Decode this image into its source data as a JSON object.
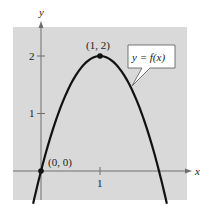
{
  "chart_data": {
    "type": "line",
    "title": "",
    "xlabel": "x",
    "ylabel": "y",
    "function_label": "y = f(x)",
    "equation_implied": "f(x) = -2(x - 1)^2 + 2",
    "xlim": [
      -0.47,
      2.48
    ],
    "ylim": [
      -0.5,
      2.5
    ],
    "x_ticks": [
      {
        "value": 1,
        "label": "1"
      }
    ],
    "y_ticks": [
      {
        "value": 1,
        "label": "1"
      },
      {
        "value": 2,
        "label": "2"
      }
    ],
    "grid": false,
    "background": "#d9d9d9",
    "curve_color": "#111111",
    "series": [
      {
        "name": "y = f(x)",
        "x": [
          -0.1,
          0,
          0.25,
          0.5,
          0.75,
          1,
          1.25,
          1.5,
          1.75,
          2,
          2.1
        ],
        "y": [
          -0.42,
          0,
          0.875,
          1.5,
          1.875,
          2,
          1.875,
          1.5,
          0.875,
          0,
          -0.42
        ]
      }
    ],
    "annotations": [
      {
        "point": [
          0,
          0
        ],
        "label": "(0, 0)"
      },
      {
        "point": [
          1,
          2
        ],
        "label": "(1, 2)"
      }
    ]
  },
  "labels": {
    "x_axis": "x",
    "y_axis": "y",
    "tick_x1": "1",
    "tick_y1": "1",
    "tick_y2": "2",
    "point_origin": "(0, 0)",
    "point_vertex": "(1, 2)",
    "callout": "y = f(x)"
  }
}
